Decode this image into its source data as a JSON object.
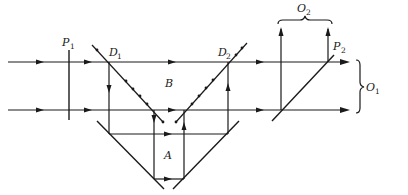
{
  "diagram": {
    "labels": {
      "P1": {
        "main": "P",
        "sub": "1"
      },
      "D1": {
        "main": "D",
        "sub": "1"
      },
      "D2": {
        "main": "D",
        "sub": "2"
      },
      "P2": {
        "main": "P",
        "sub": "2"
      },
      "B": {
        "main": "B"
      },
      "A": {
        "main": "A"
      },
      "O1": {
        "main": "O",
        "sub": "1"
      },
      "O2": {
        "main": "O",
        "sub": "2"
      }
    },
    "colors": {
      "line": "#1a1a1a",
      "background": "#ffffff"
    }
  }
}
